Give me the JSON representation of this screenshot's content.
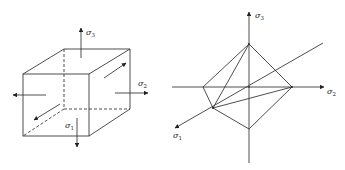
{
  "figure": {
    "left_panel": {
      "description": "Cube element under principal stresses",
      "labels": {
        "sigma3": "σ",
        "sigma3_sub": "3",
        "sigma2": "σ",
        "sigma2_sub": "2",
        "sigma1": "σ",
        "sigma1_sub": "1"
      }
    },
    "right_panel": {
      "description": "Octahedral plane in principal stress space",
      "labels": {
        "sigma3": "σ",
        "sigma3_sub": "3",
        "sigma2": "σ",
        "sigma2_sub": "2",
        "sigma1": "σ",
        "sigma1_sub": "1"
      }
    },
    "colors": {
      "line": "#3a3a3a",
      "text": "#222222",
      "background": "#ffffff"
    }
  }
}
